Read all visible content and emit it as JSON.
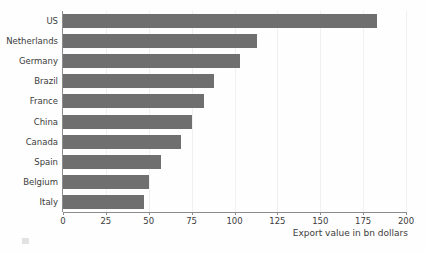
{
  "chart_data": {
    "type": "bar",
    "orientation": "horizontal",
    "title": "",
    "subtitle": "",
    "xlabel": "Export value in bn dollars",
    "ylabel": "",
    "categories": [
      "US",
      "Netherlands",
      "Germany",
      "Brazil",
      "France",
      "China",
      "Canada",
      "Spain",
      "Belgium",
      "Italy"
    ],
    "values": [
      183,
      113,
      103,
      88,
      82,
      75,
      69,
      57,
      50,
      47
    ],
    "series": [
      {
        "name": "Export value",
        "values": [
          183,
          113,
          103,
          88,
          82,
          75,
          69,
          57,
          50,
          47
        ]
      }
    ],
    "xlim": [
      0,
      200
    ],
    "xticks": [
      0,
      25,
      50,
      75,
      100,
      125,
      150,
      175,
      200
    ],
    "xtick_labels": [
      "0",
      "25",
      "50",
      "75",
      "100",
      "125",
      "150",
      "175",
      "200"
    ],
    "grid": true,
    "grid_axis": "x",
    "legend": false,
    "legend_position": "none",
    "bar_color": "#6f6f6f",
    "background_color": "#fefefe",
    "axis_color": "#8c8c8c",
    "text_color": "#3c3c3c",
    "gridline_color": "#f0f0f0"
  }
}
